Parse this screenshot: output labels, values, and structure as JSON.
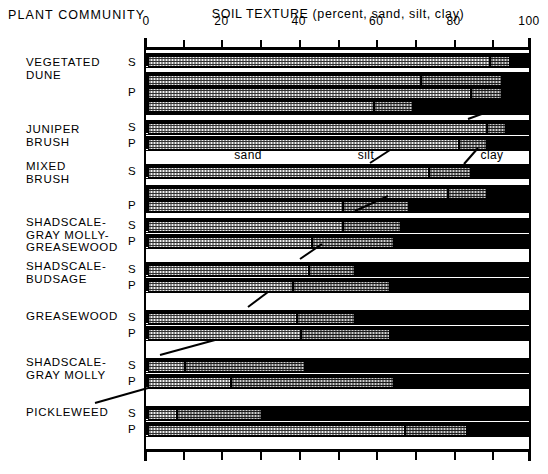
{
  "header": {
    "plant_community": "PLANT COMMUNITY",
    "title": "SOIL TEXTURE  (percent, sand, silt, clay)"
  },
  "axis": {
    "ticks_labeled": [
      "0",
      "20",
      "40",
      "60",
      "80",
      "100"
    ],
    "tick_values": [
      0,
      20,
      40,
      60,
      80,
      100
    ],
    "minor_step": 10,
    "range": [
      0,
      100
    ]
  },
  "legend": {
    "sand": "sand",
    "silt": "silt",
    "clay": "clay"
  },
  "sp": {
    "s": "S",
    "p": "P"
  },
  "colors": {
    "sand": "#f2f2f2",
    "silt": "#cfcfcf",
    "clay": "#000000",
    "outline": "#000000",
    "background": "#ffffff"
  },
  "groups": [
    {
      "name": "VEGETATED\nDUNE",
      "horizons": [
        {
          "label": "S",
          "bars": [
            {
              "sand": 89,
              "silt": 5,
              "clay": 6
            }
          ]
        },
        {
          "label": "P",
          "bars": [
            {
              "sand": 71,
              "silt": 21,
              "clay": 8
            },
            {
              "sand": 84,
              "silt": 8,
              "clay": 8
            },
            {
              "sand": 59,
              "silt": 10,
              "clay": 31
            }
          ]
        }
      ]
    },
    {
      "name": "JUNIPER\nBRUSH",
      "horizons": [
        {
          "label": "S",
          "bars": [
            {
              "sand": 88,
              "silt": 5,
              "clay": 7
            }
          ]
        },
        {
          "label": "P",
          "bars": [
            {
              "sand": 81,
              "silt": 7,
              "clay": 12
            }
          ]
        }
      ]
    },
    {
      "name": "MIXED\nBRUSH",
      "horizons": [
        {
          "label": "S",
          "bars": [
            {
              "sand": 73,
              "silt": 11,
              "clay": 16
            }
          ]
        },
        {
          "label": "P",
          "bars": [
            {
              "sand": 78,
              "silt": 10,
              "clay": 12
            },
            {
              "sand": 51,
              "silt": 17,
              "clay": 32
            }
          ]
        }
      ]
    },
    {
      "name": "SHADSCALE-\nGRAY MOLLY-\nGREASEWOOD",
      "horizons": [
        {
          "label": "S",
          "bars": [
            {
              "sand": 51,
              "silt": 15,
              "clay": 34
            }
          ]
        },
        {
          "label": "P",
          "bars": [
            {
              "sand": 43,
              "silt": 21,
              "clay": 36
            }
          ]
        }
      ]
    },
    {
      "name": "SHADSCALE-\nBUDSAGE",
      "horizons": [
        {
          "label": "S",
          "bars": [
            {
              "sand": 42,
              "silt": 12,
              "clay": 46
            }
          ]
        },
        {
          "label": "P",
          "bars": [
            {
              "sand": 38,
              "silt": 25,
              "clay": 37
            }
          ]
        }
      ]
    },
    {
      "name": "GREASEWOOD",
      "horizons": [
        {
          "label": "S",
          "bars": [
            {
              "sand": 39,
              "silt": 15,
              "clay": 46
            }
          ]
        },
        {
          "label": "P",
          "bars": [
            {
              "sand": 40,
              "silt": 23,
              "clay": 37
            }
          ]
        }
      ]
    },
    {
      "name": "SHADSCALE-\nGRAY MOLLY",
      "horizons": [
        {
          "label": "S",
          "bars": [
            {
              "sand": 10,
              "silt": 31,
              "clay": 59
            }
          ]
        },
        {
          "label": "P",
          "bars": [
            {
              "sand": 22,
              "silt": 42,
              "clay": 36
            }
          ]
        }
      ]
    },
    {
      "name": "PICKLEWEED",
      "horizons": [
        {
          "label": "S",
          "bars": [
            {
              "sand": 8,
              "silt": 22,
              "clay": 70
            }
          ]
        },
        {
          "label": "P",
          "bars": [
            {
              "sand": 67,
              "silt": 16,
              "clay": 17
            }
          ]
        }
      ]
    }
  ],
  "chart_data": {
    "type": "bar",
    "orientation": "horizontal",
    "stacked": true,
    "title": "SOIL TEXTURE  (percent, sand, silt, clay)",
    "xlabel": "",
    "ylabel": "PLANT COMMUNITY",
    "xlim": [
      0,
      100
    ],
    "xticks": [
      0,
      10,
      20,
      30,
      40,
      50,
      60,
      70,
      80,
      90,
      100
    ],
    "xtick_labels": [
      "0",
      "",
      "20",
      "",
      "40",
      "",
      "60",
      "",
      "80",
      "",
      "100"
    ],
    "grid": false,
    "legend": [
      "sand",
      "silt",
      "clay"
    ],
    "legend_position": "inline-center",
    "series": [
      {
        "name": "sand",
        "values": [
          89,
          71,
          84,
          59,
          88,
          81,
          73,
          78,
          51,
          51,
          43,
          42,
          38,
          39,
          40,
          10,
          22,
          8,
          67
        ]
      },
      {
        "name": "silt",
        "values": [
          5,
          21,
          8,
          10,
          5,
          7,
          11,
          10,
          17,
          15,
          21,
          12,
          25,
          15,
          23,
          31,
          42,
          22,
          16
        ]
      },
      {
        "name": "clay",
        "values": [
          6,
          8,
          8,
          31,
          7,
          12,
          16,
          12,
          32,
          34,
          36,
          46,
          37,
          46,
          37,
          59,
          36,
          70,
          17
        ]
      }
    ],
    "categories": [
      "VEGETATED DUNE S",
      "VEGETATED DUNE P (a)",
      "VEGETATED DUNE P (b)",
      "VEGETATED DUNE P (c)",
      "JUNIPER BRUSH S",
      "JUNIPER BRUSH P",
      "MIXED BRUSH S",
      "MIXED BRUSH P (a)",
      "MIXED BRUSH P (b)",
      "SHADSCALE-GRAY MOLLY-GREASEWOOD S",
      "SHADSCALE-GRAY MOLLY-GREASEWOOD P",
      "SHADSCALE-BUDSAGE S",
      "SHADSCALE-BUDSAGE P",
      "GREASEWOOD S",
      "GREASEWOOD P",
      "SHADSCALE-GRAY MOLLY S",
      "SHADSCALE-GRAY MOLLY P",
      "PICKLEWEED S",
      "PICKLEWEED P"
    ]
  }
}
